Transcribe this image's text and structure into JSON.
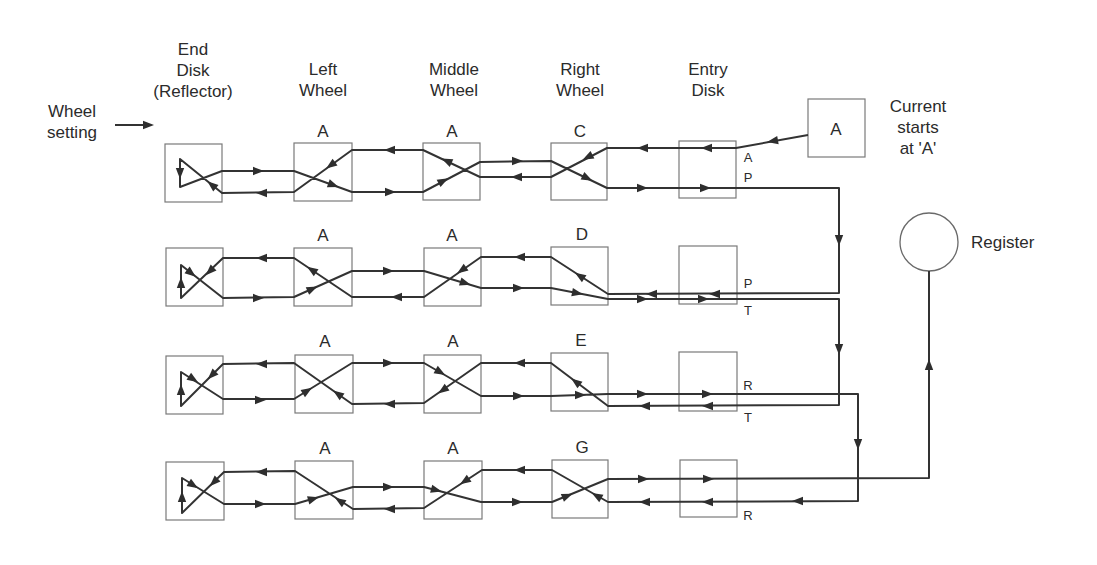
{
  "diagram": {
    "input": {
      "label_lines": [
        "Wheel",
        "setting"
      ]
    },
    "columns": [
      {
        "id": "end-disk",
        "label_lines": [
          "End",
          "Disk",
          "(Reflector)"
        ]
      },
      {
        "id": "left-wheel",
        "label_lines": [
          "Left",
          "Wheel"
        ]
      },
      {
        "id": "middle-wheel",
        "label_lines": [
          "Middle",
          "Wheel"
        ]
      },
      {
        "id": "right-wheel",
        "label_lines": [
          "Right",
          "Wheel"
        ]
      },
      {
        "id": "entry-disk",
        "label_lines": [
          "Entry",
          "Disk"
        ]
      }
    ],
    "rows": [
      {
        "left": "A",
        "middle": "A",
        "right": "C",
        "entry_top": "A",
        "entry_bottom": "P"
      },
      {
        "left": "A",
        "middle": "A",
        "right": "D",
        "entry_top": "P",
        "entry_bottom": "T"
      },
      {
        "left": "A",
        "middle": "A",
        "right": "E",
        "entry_top": "R",
        "entry_bottom": "T"
      },
      {
        "left": "A",
        "middle": "A",
        "right": "G",
        "entry_top": "",
        "entry_bottom": "R"
      }
    ],
    "source": {
      "letter": "A",
      "caption_lines": [
        "Current",
        "starts",
        "at 'A'"
      ]
    },
    "register": {
      "label": "Register"
    },
    "colors": {
      "wire": "#333333",
      "box": "#7a7a7a",
      "text": "#2b2b2b"
    }
  }
}
